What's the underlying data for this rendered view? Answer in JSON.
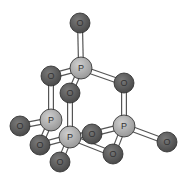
{
  "diagram": {
    "type": "ball-and-stick molecule",
    "colors": {
      "oxygen": "#5e5e5e",
      "phosphorus": "#b0b0b0",
      "outline": "#2a2a2a",
      "bond_outline": "#555555",
      "bond_fill": "#ffffff"
    },
    "atoms": [
      {
        "id": "O1",
        "label": "O",
        "element": "O",
        "x": 80,
        "y": 23
      },
      {
        "id": "P1",
        "label": "P",
        "element": "P",
        "x": 81,
        "y": 68
      },
      {
        "id": "O2",
        "label": "O",
        "element": "O",
        "x": 51,
        "y": 76
      },
      {
        "id": "O3",
        "label": "O",
        "element": "O",
        "x": 124,
        "y": 83
      },
      {
        "id": "O4",
        "label": "O",
        "element": "O",
        "x": 70,
        "y": 93
      },
      {
        "id": "O5",
        "label": "O",
        "element": "O",
        "x": 92,
        "y": 134
      },
      {
        "id": "P2",
        "label": "P",
        "element": "P",
        "x": 51,
        "y": 120
      },
      {
        "id": "O6",
        "label": "O",
        "element": "O",
        "x": 20,
        "y": 126
      },
      {
        "id": "P4",
        "label": "P",
        "element": "P",
        "x": 124,
        "y": 126
      },
      {
        "id": "O7",
        "label": "O",
        "element": "O",
        "x": 167,
        "y": 142
      },
      {
        "id": "O8",
        "label": "O",
        "element": "O",
        "x": 40,
        "y": 145
      },
      {
        "id": "P3",
        "label": "P",
        "element": "P",
        "x": 70,
        "y": 137
      },
      {
        "id": "O9",
        "label": "O",
        "element": "O",
        "x": 113,
        "y": 154
      },
      {
        "id": "O10",
        "label": "O",
        "element": "O",
        "x": 60,
        "y": 162
      }
    ],
    "bonds": [
      [
        "O1",
        "P1"
      ],
      [
        "P1",
        "O2"
      ],
      [
        "P1",
        "O3"
      ],
      [
        "P1",
        "O4"
      ],
      [
        "O2",
        "P2"
      ],
      [
        "O3",
        "P4"
      ],
      [
        "O4",
        "P3"
      ],
      [
        "P2",
        "O6"
      ],
      [
        "P2",
        "O8"
      ],
      [
        "P3",
        "O8"
      ],
      [
        "P3",
        "O5"
      ],
      [
        "P3",
        "O9"
      ],
      [
        "P3",
        "O10"
      ],
      [
        "P4",
        "O5"
      ],
      [
        "P4",
        "O7"
      ],
      [
        "P4",
        "O9"
      ]
    ]
  }
}
